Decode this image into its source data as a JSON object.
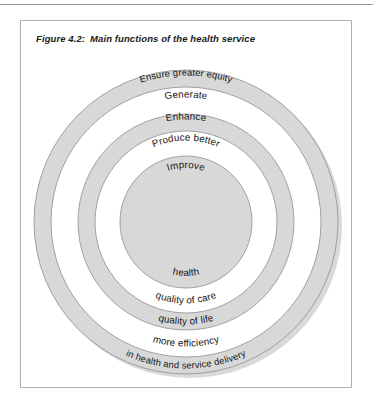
{
  "figure": {
    "number": "Figure 4.2:",
    "title": "Main functions of the health service"
  },
  "diagram": {
    "type": "concentric-rings",
    "center": {
      "x": 186,
      "y": 222
    },
    "colors": {
      "ring_fill": "#d8d8d8",
      "ring_stroke": "#8e8e8e",
      "gap_fill": "#ffffff",
      "text": "#151515",
      "box_border": "#b0b0b0",
      "shadow": "#b9b9b9"
    },
    "rings": [
      {
        "index": 1,
        "name": "outer-ring",
        "kind": "band",
        "outer_radius": 152,
        "inner_radius": 135,
        "top_label": "Ensure greater equity",
        "bottom_label": "in health and service delivery"
      },
      {
        "index": 2,
        "name": "outer-gap",
        "kind": "gap",
        "outer_radius": 135,
        "inner_radius": 108,
        "top_label": "Generate",
        "bottom_label": "more efficiency"
      },
      {
        "index": 3,
        "name": "middle-ring",
        "kind": "band",
        "outer_radius": 108,
        "inner_radius": 91,
        "top_label": "Enhance",
        "bottom_label": "quality of life"
      },
      {
        "index": 4,
        "name": "inner-gap",
        "kind": "gap",
        "outer_radius": 91,
        "inner_radius": 66,
        "top_label": "Produce better",
        "bottom_label": "quality of care"
      },
      {
        "index": 5,
        "name": "center-disk",
        "kind": "disk",
        "outer_radius": 66,
        "inner_radius": 0,
        "top_label": "Improve",
        "bottom_label": "health"
      }
    ]
  }
}
